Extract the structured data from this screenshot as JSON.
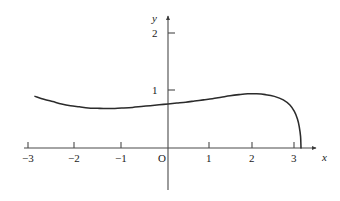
{
  "chart_data": {
    "type": "line",
    "title": "",
    "subtitle": "",
    "xlabel": "x",
    "ylabel": "y",
    "origin_label": "O",
    "xlim": [
      -3.25,
      3.55
    ],
    "ylim": [
      -0.55,
      2.45
    ],
    "xticks": [
      -3,
      -2,
      -1,
      1,
      2,
      3
    ],
    "xtick_labels": [
      "−3",
      "−2",
      "−1",
      "1",
      "2",
      "3"
    ],
    "yticks": [
      1,
      2
    ],
    "ytick_labels": [
      "1",
      "2"
    ],
    "grid": false,
    "legend": null,
    "legend_position": "none",
    "curve_color": "#2b2b2b",
    "axis_color": "#4a4a4a",
    "background_color": "#ffffff",
    "series": [
      {
        "name": "curve",
        "x": [
          -3.0,
          -2.8,
          -2.6,
          -2.4,
          -2.2,
          -2.0,
          -1.8,
          -1.6,
          -1.4,
          -1.2,
          -1.0,
          -0.8,
          -0.6,
          -0.4,
          -0.2,
          0.0,
          0.2,
          0.4,
          0.6,
          0.8,
          1.0,
          1.2,
          1.4,
          1.6,
          1.8,
          2.0,
          2.2,
          2.4,
          2.6,
          2.75,
          2.85,
          2.92,
          2.96,
          2.99,
          3.0
        ],
        "y": [
          0.89,
          0.84,
          0.8,
          0.76,
          0.73,
          0.71,
          0.69,
          0.685,
          0.68,
          0.682,
          0.69,
          0.7,
          0.715,
          0.73,
          0.745,
          0.76,
          0.775,
          0.79,
          0.81,
          0.83,
          0.85,
          0.875,
          0.9,
          0.92,
          0.935,
          0.935,
          0.92,
          0.89,
          0.83,
          0.74,
          0.63,
          0.5,
          0.37,
          0.2,
          0.0
        ]
      }
    ],
    "annotations": [
      {
        "text": "curve has a vertical tangent at x = 3 where it meets the x-axis",
        "visible": false
      }
    ]
  },
  "axes": {
    "y_axis_label": "y",
    "x_axis_label": "x",
    "origin": "O"
  }
}
